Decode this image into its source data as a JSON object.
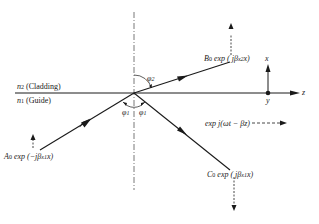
{
  "diagram": {
    "type": "waveguide-reflection-refraction",
    "medium_upper": {
      "label_n": "n",
      "label_sub": "2",
      "label_name": "(Cladding)"
    },
    "medium_lower": {
      "label_n": "n",
      "label_sub": "1",
      "label_name": "(Guide)"
    },
    "angles": {
      "phi2": {
        "sym": "φ",
        "sub": "2"
      },
      "phi1_left": {
        "sym": "φ",
        "sub": "1"
      },
      "phi1_right": {
        "sym": "φ",
        "sub": "1"
      }
    },
    "incident_wave": {
      "coef": "A",
      "coef_sub": "0",
      "expr_pre": " exp (−jβ",
      "expr_sub": "x1",
      "expr_post": "x)"
    },
    "refracted_wave": {
      "coef": "B",
      "coef_sub": "0",
      "expr_pre": " exp (  jβ",
      "expr_sub": "x2",
      "expr_post": "x)"
    },
    "reflected_wave": {
      "coef": "C",
      "coef_sub": "0",
      "expr_pre": " exp ( jβ",
      "expr_sub": "x1",
      "expr_post": "x)"
    },
    "propagation": {
      "expr": "exp j(ωt − βz)"
    },
    "axes": {
      "x": "x",
      "y": "y",
      "z": "z"
    },
    "colors": {
      "line": "#1a1a1a",
      "background": "#ffffff"
    }
  }
}
